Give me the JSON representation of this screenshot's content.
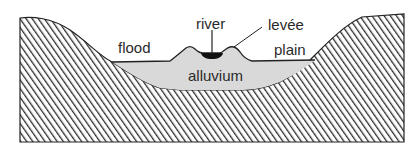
{
  "diagram": {
    "type": "cross-section",
    "labels": {
      "river": "river",
      "levee": "levée",
      "flood": "flood",
      "plain": "plain",
      "alluvium": "alluvium"
    },
    "colors": {
      "bedrock_hatch": "#2b2b2b",
      "bedrock_background": "#ffffff",
      "alluvium_fill": "#d9d9d9",
      "river_water": "#111111",
      "outline": "#222222",
      "label_text": "#2a2a2a"
    }
  }
}
